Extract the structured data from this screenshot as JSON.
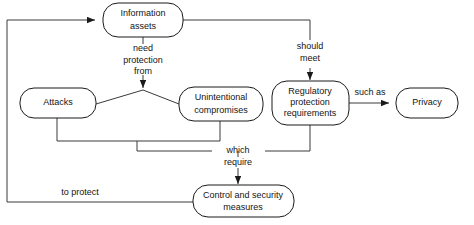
{
  "diagram": {
    "background_color": "#ffffff",
    "node_stroke_color": "#1a1a1a",
    "edge_stroke_color": "#3a3a3a",
    "text_color": "#141414",
    "nodes": [
      {
        "id": "information-assets",
        "line1": "Information",
        "line2": "assets",
        "shape": "rounded-rectangle"
      },
      {
        "id": "attacks",
        "line1": "Attacks",
        "line2": "",
        "shape": "rounded-rectangle"
      },
      {
        "id": "unintentional-compromises",
        "line1": "Unintentional",
        "line2": "compromises",
        "shape": "rounded-rectangle"
      },
      {
        "id": "regulatory-protection-requirements",
        "line1": "Regulatory",
        "line2": "protection",
        "line3": "requirements",
        "shape": "rounded-rectangle"
      },
      {
        "id": "privacy",
        "line1": "Privacy",
        "line2": "",
        "shape": "rounded-rectangle"
      },
      {
        "id": "control-and-security-measures",
        "line1": "Control  and  security",
        "line2": "measures",
        "shape": "rounded-rectangle"
      }
    ],
    "edge_labels": {
      "need_protection_from_l1": "need",
      "need_protection_from_l2": "protection",
      "need_protection_from_l3": "from",
      "should_meet_l1": "should",
      "should_meet_l2": "meet",
      "such_as": "such as",
      "which_require_l1": "which",
      "which_require_l2": "require",
      "to_protect": "to protect"
    }
  }
}
